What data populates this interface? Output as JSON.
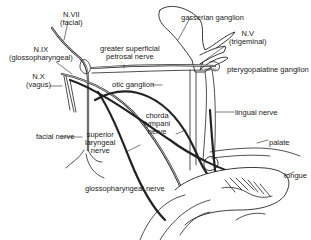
{
  "diagram": {
    "labels": {
      "n7": "N.VII",
      "n7_name": "(facial)",
      "n9": "N.IX",
      "n9_name": "(glossopharyngeal)",
      "n10": "N.X",
      "n10_name": "(vagus)",
      "gasserian": "gasserian ganglion",
      "n5": "N.V",
      "n5_name": "(trigeminal)",
      "gsp_line1": "greater superficial",
      "gsp_line2": "petrosal nerve",
      "pterygopalatine": "pterygopalatine ganglion",
      "otic": "otic ganglion",
      "lingual": "lingual nerve",
      "chorda_line1": "chorda",
      "chorda_line2": "tympani",
      "chorda_line3": "nerve",
      "facial_nerve": "facial nerve",
      "sup_lar_line1": "superior",
      "sup_lar_line2": "laryngeal",
      "sup_lar_line3": "nerve",
      "palate": "palate",
      "tongue": "tongue",
      "glosso_nerve": "glossopharyngeal nerve"
    }
  }
}
